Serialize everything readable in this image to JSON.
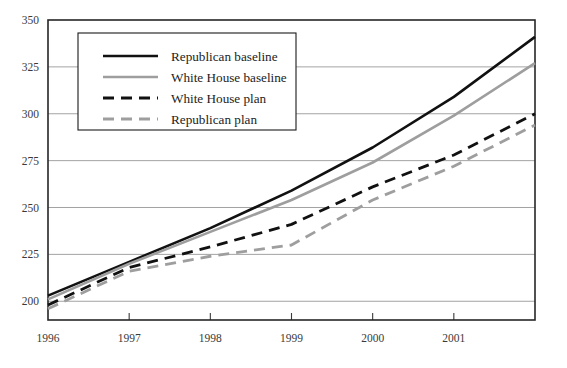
{
  "chart_data": {
    "type": "line",
    "title": "",
    "xlabel": "",
    "ylabel": "",
    "x": [
      1996,
      1997,
      1998,
      1999,
      2000,
      2001,
      2002
    ],
    "xtick_labels": [
      "1996",
      "1997",
      "1998",
      "1999",
      "2000",
      "2001"
    ],
    "ytick_labels": [
      "200",
      "225",
      "250",
      "275",
      "300",
      "325",
      "350"
    ],
    "ylim": [
      190,
      350
    ],
    "xlim": [
      1996,
      2002
    ],
    "yticks": [
      200,
      225,
      250,
      275,
      300,
      325,
      350
    ],
    "grid": "horizontal",
    "legend_position": "top-left",
    "series": [
      {
        "name": "Republican baseline",
        "color": "#111111",
        "style": "solid",
        "width": 2.6,
        "values": [
          203,
          221,
          239,
          259,
          282,
          309,
          341
        ]
      },
      {
        "name": "White House baseline",
        "color": "#9e9e9e",
        "style": "solid",
        "width": 2.6,
        "values": [
          201,
          220,
          237,
          254,
          274,
          299,
          327
        ]
      },
      {
        "name": "White House plan",
        "color": "#111111",
        "style": "dashed",
        "width": 2.8,
        "values": [
          198,
          218,
          229,
          241,
          261,
          278,
          300
        ]
      },
      {
        "name": "Republican plan",
        "color": "#9e9e9e",
        "style": "dashed",
        "width": 2.8,
        "values": [
          196,
          216,
          224,
          230,
          254,
          272,
          294
        ]
      }
    ]
  },
  "legend": {
    "items": [
      {
        "label": "Republican baseline"
      },
      {
        "label": "White House baseline"
      },
      {
        "label": "White House plan"
      },
      {
        "label": "Republican plan"
      }
    ]
  },
  "colors": {
    "black_series": "#111111",
    "gray_series": "#9e9e9e",
    "frame": "#262626",
    "gridline": "#8b8b8b",
    "background": "#ffffff"
  }
}
